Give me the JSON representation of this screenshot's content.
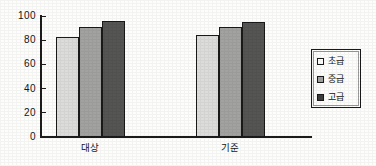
{
  "chart_data": {
    "type": "bar",
    "title": "",
    "xlabel": "",
    "ylabel": "",
    "categories": [
      "대상",
      "기준"
    ],
    "series": [
      {
        "name": "초급",
        "values": [
          83,
          84
        ],
        "color": "#dcdcda"
      },
      {
        "name": "중급",
        "values": [
          91,
          91
        ],
        "color": "#a2a2a0"
      },
      {
        "name": "고급",
        "values": [
          96,
          95
        ],
        "color": "#555553"
      }
    ],
    "ylim": [
      0,
      100
    ],
    "yticks": [
      0,
      20,
      40,
      60,
      80,
      100
    ],
    "ytick_labels": [
      "0",
      "20",
      "40",
      "60",
      "80",
      "100"
    ],
    "grid": false,
    "legend_position": "right"
  },
  "legend": {
    "items": [
      {
        "label": "초급"
      },
      {
        "label": "중급"
      },
      {
        "label": "고급"
      }
    ]
  },
  "axis": {
    "ticks": [
      {
        "label": "100"
      },
      {
        "label": "80"
      },
      {
        "label": "60"
      },
      {
        "label": "40"
      },
      {
        "label": "20"
      },
      {
        "label": "0"
      }
    ]
  },
  "groups": [
    {
      "label": "대상"
    },
    {
      "label": "기준"
    }
  ]
}
